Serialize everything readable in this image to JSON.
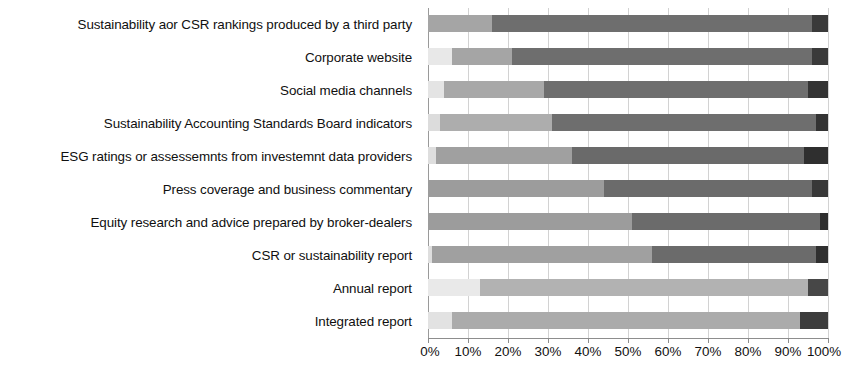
{
  "chart_data": {
    "type": "bar",
    "orientation": "horizontal",
    "stacked": true,
    "normalized": true,
    "title": "",
    "subtitle": "",
    "xlabel": "",
    "ylabel": "",
    "xlim": [
      0,
      100
    ],
    "grid": true,
    "legend": "none",
    "xticks": [
      "0%",
      "10%",
      "20%",
      "30%",
      "40%",
      "50%",
      "60%",
      "70%",
      "80%",
      "90%",
      "100%"
    ],
    "xtick_values": [
      0,
      10,
      20,
      30,
      40,
      50,
      60,
      70,
      80,
      90,
      100
    ],
    "categories": [
      "Sustainability aor CSR rankings produced by a third party",
      "Corporate website",
      "Social media channels",
      "Sustainability Accounting Standards Board indicators",
      "ESG ratings or assessemnts from investemnt data providers",
      "Press coverage and business commentary",
      "Equity research and advice prepared by broker-dealers",
      "CSR or sustainability report",
      "Annual report",
      "Integrated report"
    ],
    "series": [
      {
        "name": "Series 1",
        "color": "#e8e8e8",
        "values": [
          0,
          6,
          4,
          3,
          2,
          0,
          0,
          1,
          13,
          6
        ]
      },
      {
        "name": "Series 2",
        "color": "#a5a5a5",
        "values": [
          16,
          15,
          25,
          28,
          34,
          44,
          51,
          55,
          82,
          87
        ]
      },
      {
        "name": "Series 3",
        "color": "#6e6e6e",
        "values": [
          80,
          75,
          66,
          66,
          58,
          52,
          47,
          41,
          0,
          0
        ]
      },
      {
        "name": "Series 4",
        "color": "#3a3a3a",
        "values": [
          4,
          4,
          5,
          3,
          6,
          4,
          2,
          3,
          5,
          7
        ]
      }
    ],
    "row_segments": [
      [
        {
          "color": "#a5a5a5",
          "value": 16
        },
        {
          "color": "#6e6e6e",
          "value": 80
        },
        {
          "color": "#3a3a3a",
          "value": 4
        }
      ],
      [
        {
          "color": "#e8e8e8",
          "value": 6
        },
        {
          "color": "#a5a5a5",
          "value": 15
        },
        {
          "color": "#6e6e6e",
          "value": 75
        },
        {
          "color": "#3a3a3a",
          "value": 4
        }
      ],
      [
        {
          "color": "#e4e4e4",
          "value": 4
        },
        {
          "color": "#a8a8a8",
          "value": 25
        },
        {
          "color": "#6e6e6e",
          "value": 66
        },
        {
          "color": "#343434",
          "value": 5
        }
      ],
      [
        {
          "color": "#dcdcdc",
          "value": 3
        },
        {
          "color": "#adadad",
          "value": 28
        },
        {
          "color": "#6e6e6e",
          "value": 66
        },
        {
          "color": "#333333",
          "value": 3
        }
      ],
      [
        {
          "color": "#dedede",
          "value": 2
        },
        {
          "color": "#a0a0a0",
          "value": 34
        },
        {
          "color": "#6a6a6a",
          "value": 58
        },
        {
          "color": "#2f2f2f",
          "value": 6
        }
      ],
      [
        {
          "color": "#9c9c9c",
          "value": 44
        },
        {
          "color": "#6b6b6b",
          "value": 52
        },
        {
          "color": "#383838",
          "value": 4
        }
      ],
      [
        {
          "color": "#9c9c9c",
          "value": 51
        },
        {
          "color": "#6b6b6b",
          "value": 47
        },
        {
          "color": "#2e2e2e",
          "value": 2
        }
      ],
      [
        {
          "color": "#dedede",
          "value": 1
        },
        {
          "color": "#a0a0a0",
          "value": 55
        },
        {
          "color": "#6b6b6b",
          "value": 41
        },
        {
          "color": "#303030",
          "value": 3
        }
      ],
      [
        {
          "color": "#e9e9e9",
          "value": 13
        },
        {
          "color": "#b2b2b2",
          "value": 82
        },
        {
          "color": "#474747",
          "value": 5
        }
      ],
      [
        {
          "color": "#e2e2e2",
          "value": 6
        },
        {
          "color": "#ababab",
          "value": 87
        },
        {
          "color": "#3c3c3c",
          "value": 7
        }
      ]
    ]
  },
  "axis": {
    "tick_labels": [
      "0%",
      "10%",
      "20%",
      "30%",
      "40%",
      "50%",
      "60%",
      "70%",
      "80%",
      "90%",
      "100%"
    ]
  }
}
